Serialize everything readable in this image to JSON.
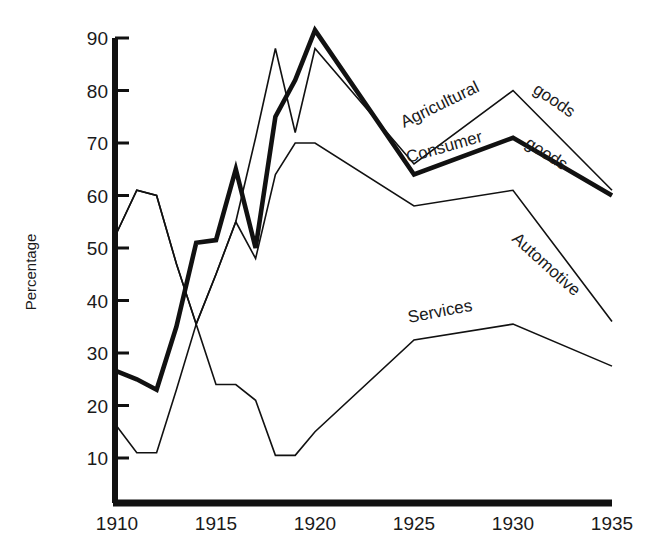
{
  "chart_data": {
    "type": "line",
    "title": "",
    "xlabel": "",
    "ylabel": "Percentage",
    "xlim": [
      1910,
      1935
    ],
    "ylim": [
      0,
      90
    ],
    "grid": false,
    "legend_position": "inline-labels",
    "yticks": [
      10,
      20,
      30,
      40,
      50,
      60,
      70,
      80,
      90
    ],
    "ytick_labels": [
      "10",
      "20",
      "30",
      "40",
      "50",
      "60",
      "70",
      "80",
      "90"
    ],
    "xticks": [
      1910,
      1915,
      1920,
      1925,
      1930,
      1935
    ],
    "xtick_labels": [
      "1910",
      "1915",
      "1920",
      "1925",
      "1930",
      "1935"
    ],
    "x": [
      1910,
      1911,
      1912,
      1913,
      1914,
      1915,
      1916,
      1917,
      1918,
      1919,
      1920,
      1925,
      1930,
      1935
    ],
    "series": [
      {
        "name": "Agricultural goods",
        "style": "thin",
        "label": "Agricultural goods",
        "values": [
          53,
          61,
          60,
          47,
          35.5,
          45,
          55,
          71,
          88,
          72,
          88,
          66,
          80,
          61
        ]
      },
      {
        "name": "Consumer goods",
        "style": "thick",
        "label": "Consumer goods",
        "values": [
          26.5,
          25,
          23,
          35,
          51,
          51.5,
          65,
          50,
          75,
          82,
          91.5,
          64,
          71,
          60
        ]
      },
      {
        "name": "Automotive",
        "style": "thin",
        "label": "Automotive",
        "values": [
          53,
          61,
          60,
          47,
          35.5,
          45,
          55,
          48,
          64,
          70,
          70,
          58,
          61,
          36
        ]
      },
      {
        "name": "Services",
        "style": "thin",
        "label": "Services",
        "values": [
          16,
          11,
          11,
          23,
          35.5,
          24,
          24,
          21,
          10.5,
          10.5,
          15,
          32.5,
          35.5,
          27.5
        ]
      }
    ]
  },
  "axes": {
    "y_axis_title": "Percentage",
    "y_labels": [
      "90",
      "80",
      "70",
      "60",
      "50",
      "40",
      "30",
      "20",
      "10"
    ],
    "x_labels": [
      "1910",
      "1915",
      "1920",
      "1925",
      "1930",
      "1935"
    ]
  },
  "series_labels": {
    "agricultural": "Agricultural",
    "agricultural_goods": "goods",
    "consumer": "Consumer",
    "consumer_goods": "goods",
    "automotive": "Automotive",
    "services": "Services"
  },
  "colors": {
    "ink": "#111111",
    "background": "#ffffff"
  }
}
